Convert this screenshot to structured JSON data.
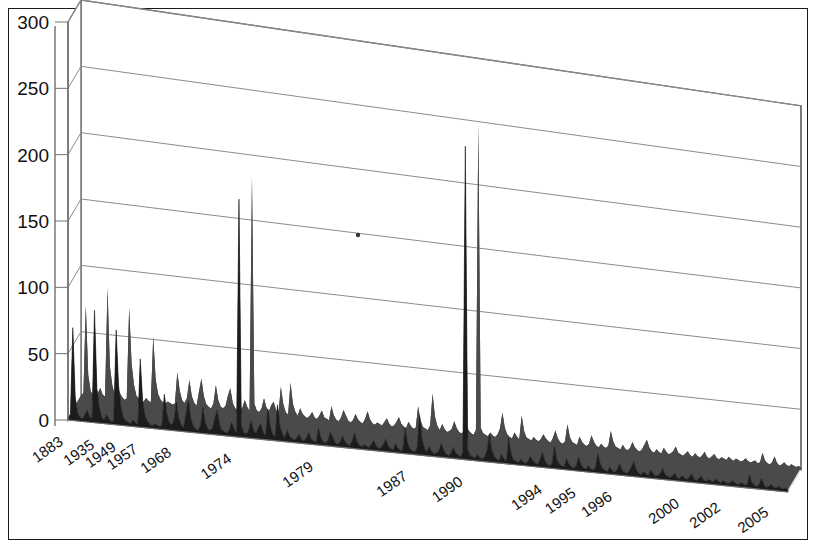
{
  "chart_data": {
    "type": "area",
    "title": "",
    "subtitle": "",
    "xlabel": "",
    "ylabel": "",
    "style": "3d-area-spikes",
    "grid": true,
    "legend": null,
    "ylim": [
      0,
      300
    ],
    "yticks": [
      0,
      50,
      100,
      150,
      200,
      250,
      300
    ],
    "ytick_labels": [
      "0",
      "50",
      "100",
      "150",
      "200",
      "250",
      "300"
    ],
    "xtick_labels": [
      "1883",
      "1935",
      "1949",
      "1957",
      "1968",
      "1974",
      "1979",
      "1987",
      "1990",
      "1994",
      "1995",
      "1996",
      "2000",
      "2002",
      "2005"
    ],
    "xtick_positions": [
      0,
      13,
      22,
      31,
      45,
      70,
      104,
      143,
      166,
      199,
      213,
      228,
      256,
      273,
      293
    ],
    "n_points": 300,
    "series_name": "count",
    "annotations": [
      {
        "x": 300,
        "label": "small dot marker on 150 gridline"
      }
    ],
    "values": [
      2,
      4,
      70,
      18,
      6,
      3,
      2,
      5,
      9,
      4,
      3,
      85,
      26,
      12,
      5,
      3,
      7,
      4,
      2,
      3,
      72,
      30,
      14,
      6,
      4,
      3,
      2,
      5,
      3,
      2,
      52,
      20,
      9,
      5,
      3,
      2,
      4,
      3,
      2,
      3,
      27,
      13,
      6,
      4,
      8,
      22,
      10,
      5,
      3,
      14,
      24,
      11,
      5,
      3,
      2,
      6,
      20,
      9,
      4,
      3,
      5,
      13,
      19,
      8,
      4,
      3,
      2,
      5,
      11,
      6,
      3,
      183,
      9,
      4,
      3,
      6,
      14,
      7,
      4,
      9,
      12,
      6,
      3,
      24,
      11,
      5,
      3,
      28,
      12,
      6,
      3,
      9,
      5,
      3,
      2,
      4,
      7,
      3,
      2,
      5,
      9,
      4,
      3,
      2,
      13,
      6,
      3,
      2,
      5,
      11,
      7,
      3,
      2,
      4,
      9,
      5,
      3,
      2,
      6,
      12,
      6,
      3,
      2,
      4,
      3,
      2,
      5,
      8,
      4,
      2,
      3,
      6,
      10,
      5,
      3,
      2,
      7,
      4,
      2,
      3,
      20,
      9,
      4,
      3,
      2,
      6,
      31,
      13,
      6,
      3,
      8,
      4,
      2,
      3,
      5,
      11,
      6,
      3,
      2,
      4,
      9,
      5,
      3,
      2,
      6,
      248,
      8,
      4,
      3,
      2,
      5,
      3,
      2,
      4,
      9,
      22,
      10,
      5,
      3,
      2,
      7,
      4,
      2,
      21,
      9,
      4,
      3,
      2,
      5,
      3,
      2,
      4,
      8,
      5,
      3,
      2,
      6,
      12,
      6,
      3,
      2,
      4,
      18,
      8,
      4,
      3,
      2,
      9,
      5,
      3,
      2,
      4,
      11,
      6,
      3,
      2,
      5,
      3,
      2,
      4,
      16,
      8,
      4,
      3,
      2,
      6,
      3,
      2,
      4,
      9,
      5,
      3,
      2,
      4,
      8,
      12,
      6,
      3,
      2,
      5,
      3,
      2,
      7,
      4,
      2,
      3,
      5,
      9,
      4,
      3,
      2,
      4,
      6,
      3,
      2,
      5,
      3,
      2,
      4,
      7,
      3,
      2,
      4,
      6,
      3,
      2,
      4,
      3,
      2,
      5,
      3,
      2,
      4,
      3,
      2,
      3,
      5,
      3,
      2,
      3,
      4,
      2,
      3,
      11,
      5,
      3,
      2,
      4,
      9,
      4,
      2,
      3,
      5,
      3,
      2,
      4,
      3,
      2,
      3,
      2
    ]
  },
  "colors": {
    "plot_fill": "#1c1c1c",
    "plot_side": "#4a4a4a",
    "floor": "#b9b9b9",
    "floor_top": "#d4d4d4",
    "wall": "#ffffff",
    "gridline": "#8c8c8c",
    "axis": "#707070",
    "border": "#1a1a1a",
    "text": "#111111"
  },
  "geometry": {
    "depth_dx": 13,
    "depth_dy": -22,
    "front_left_x": 68,
    "front_base_y": 420,
    "front_right_x": 788,
    "right_base_y": 492,
    "top_y": 22
  }
}
